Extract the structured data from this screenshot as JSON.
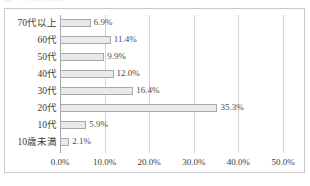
{
  "top_strip": {
    "ghost_text": "図  年代別構成比  ・・・・"
  },
  "chart_data": {
    "type": "bar",
    "orientation": "horizontal",
    "title": "",
    "xlabel": "",
    "ylabel": "",
    "categories": [
      "70代以上",
      "60代",
      "50代",
      "40代",
      "30代",
      "20代",
      "10代",
      "10歳未満"
    ],
    "values": [
      6.9,
      11.4,
      9.9,
      12.0,
      16.4,
      35.3,
      5.9,
      2.1
    ],
    "data_labels": [
      "6.9%",
      "11.4%",
      "9.9%",
      "12.0%",
      "16.4%",
      "35.3%",
      "5.9%",
      "2.1%"
    ],
    "xlim": [
      0.0,
      50.0
    ],
    "xticks": [
      0.0,
      10.0,
      20.0,
      30.0,
      40.0,
      50.0
    ],
    "xtick_labels": [
      "0.0%",
      "10.0%",
      "20.0%",
      "30.0%",
      "40.0%",
      "50.0%"
    ],
    "grid": true,
    "grid_axis": "x",
    "legend": false,
    "legend_position": "none",
    "colors": {
      "bar_fill": "#e9e9e9",
      "bar_border": "#a9a9a9",
      "gridline": "#d4d4d4",
      "axis": "#a8a8a8",
      "frame": "#c9c9c9",
      "text": "#3a3a3a",
      "background": "#ffffff"
    }
  }
}
